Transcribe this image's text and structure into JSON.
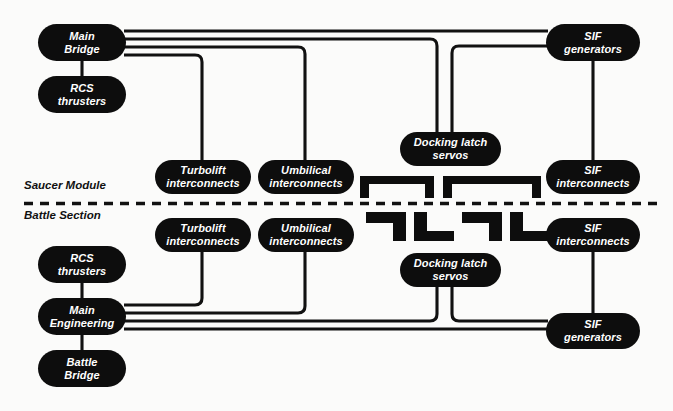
{
  "diagram": {
    "background_color": "#fbfbfa",
    "node_color": "#0d0d0d",
    "node_text_color": "#ffffff",
    "wire_color": "#111111",
    "section_labels": {
      "upper": "Saucer Module",
      "lower": "Battle Section"
    },
    "nodes": [
      {
        "id": "main-bridge",
        "section": "saucer",
        "line1": "Main",
        "line2": "Bridge",
        "x": 38,
        "y": 24,
        "w": 88,
        "h": 37
      },
      {
        "id": "rcs-thrusters-saucer",
        "section": "saucer",
        "line1": "RCS",
        "line2": "thrusters",
        "x": 38,
        "y": 76,
        "w": 88,
        "h": 37
      },
      {
        "id": "turbolift-saucer",
        "section": "saucer",
        "line1": "Turbolift",
        "line2": "interconnects",
        "x": 155,
        "y": 160,
        "w": 96,
        "h": 34
      },
      {
        "id": "umbilical-saucer",
        "section": "saucer",
        "line1": "Umbilical",
        "line2": "interconnects",
        "x": 258,
        "y": 160,
        "w": 96,
        "h": 34
      },
      {
        "id": "docking-latch-saucer",
        "section": "saucer",
        "line1": "Docking latch",
        "line2": "servos",
        "x": 400,
        "y": 132,
        "w": 101,
        "h": 34
      },
      {
        "id": "sif-generators-saucer",
        "section": "saucer",
        "line1": "SIF",
        "line2": "generators",
        "x": 546,
        "y": 24,
        "w": 94,
        "h": 37
      },
      {
        "id": "sif-interconnects-saucer",
        "section": "saucer",
        "line1": "SIF",
        "line2": "interconnects",
        "x": 546,
        "y": 160,
        "w": 94,
        "h": 34
      },
      {
        "id": "turbolift-battle",
        "section": "battle",
        "line1": "Turbolift",
        "line2": "interconnects",
        "x": 155,
        "y": 218,
        "w": 96,
        "h": 34
      },
      {
        "id": "umbilical-battle",
        "section": "battle",
        "line1": "Umbilical",
        "line2": "interconnects",
        "x": 258,
        "y": 218,
        "w": 96,
        "h": 34
      },
      {
        "id": "sif-interconnects-battle",
        "section": "battle",
        "line1": "SIF",
        "line2": "interconnects",
        "x": 546,
        "y": 218,
        "w": 94,
        "h": 34
      },
      {
        "id": "rcs-thrusters-battle",
        "section": "battle",
        "line1": "RCS",
        "line2": "thrusters",
        "x": 38,
        "y": 246,
        "w": 88,
        "h": 37
      },
      {
        "id": "docking-latch-battle",
        "section": "battle",
        "line1": "Docking latch",
        "line2": "servos",
        "x": 400,
        "y": 253,
        "w": 101,
        "h": 34
      },
      {
        "id": "main-engineering",
        "section": "battle",
        "line1": "Main",
        "line2": "Engineering",
        "x": 38,
        "y": 298,
        "w": 88,
        "h": 37
      },
      {
        "id": "sif-generators-battle",
        "section": "battle",
        "line1": "SIF",
        "line2": "generators",
        "x": 546,
        "y": 313,
        "w": 94,
        "h": 36
      },
      {
        "id": "battle-bridge",
        "section": "battle",
        "line1": "Battle",
        "line2": "Bridge",
        "x": 38,
        "y": 350,
        "w": 88,
        "h": 37
      }
    ],
    "connections": [
      {
        "from": "main-bridge",
        "to": "rcs-thrusters-saucer"
      },
      {
        "from": "main-bridge",
        "to": "sif-generators-saucer"
      },
      {
        "from": "main-bridge",
        "to": "docking-latch-saucer"
      },
      {
        "from": "main-bridge",
        "to": "umbilical-saucer"
      },
      {
        "from": "main-bridge",
        "to": "turbolift-saucer"
      },
      {
        "from": "sif-generators-saucer",
        "to": "sif-interconnects-saucer"
      },
      {
        "from": "sif-generators-saucer",
        "to": "docking-latch-saucer"
      },
      {
        "from": "main-engineering",
        "to": "rcs-thrusters-battle"
      },
      {
        "from": "main-engineering",
        "to": "battle-bridge"
      },
      {
        "from": "main-engineering",
        "to": "turbolift-battle"
      },
      {
        "from": "main-engineering",
        "to": "umbilical-battle"
      },
      {
        "from": "main-engineering",
        "to": "docking-latch-battle"
      },
      {
        "from": "main-engineering",
        "to": "sif-generators-battle"
      },
      {
        "from": "sif-generators-battle",
        "to": "sif-interconnects-battle"
      },
      {
        "from": "sif-generators-battle",
        "to": "docking-latch-battle"
      }
    ],
    "latch_brackets": {
      "upper_count": 2,
      "lower_count": 4,
      "description": "Docking latch clamp profiles straddling the separation plane"
    },
    "separation_line": {
      "style": "dashed",
      "y": 203
    }
  }
}
